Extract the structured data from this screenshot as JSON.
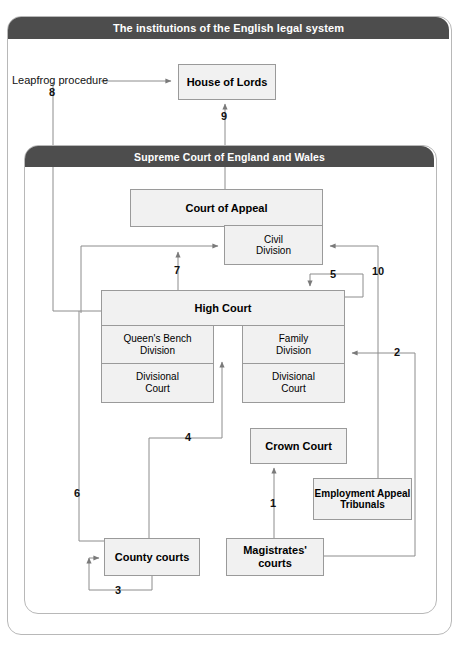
{
  "outer_frame": {
    "title": "The institutions of the English legal system"
  },
  "inner_frame": {
    "title": "Supreme Court of England and Wales"
  },
  "nodes": {
    "house_of_lords": "House of Lords",
    "court_of_appeal": "Court of Appeal",
    "civil_division": "Civil\nDivision",
    "civil_division_line1": "Civil",
    "civil_division_line2": "Division",
    "high_court": "High Court",
    "queens_bench_division_line1": "Queen's Bench",
    "queens_bench_division_line2": "Division",
    "qb_divisional_court_line1": "Divisional",
    "qb_divisional_court_line2": "Court",
    "family_division_line1": "Family",
    "family_division_line2": "Division",
    "fam_divisional_court_line1": "Divisional",
    "fam_divisional_court_line2": "Court",
    "crown_court": "Crown Court",
    "employment_appeal_tribunals_line1": "Employment Appeal",
    "employment_appeal_tribunals_line2": "Tribunals",
    "county_courts": "County courts",
    "magistrates_courts_line1": "Magistrates'",
    "magistrates_courts_line2": "courts"
  },
  "annotations": {
    "leapfrog": "Leapfrog procedure",
    "route_1": "1",
    "route_2": "2",
    "route_3": "3",
    "route_4": "4",
    "route_5": "5",
    "route_6": "6",
    "route_7": "7",
    "route_8": "8",
    "route_9": "9",
    "route_10": "10"
  },
  "colors": {
    "header_bar": "#4d4d4d",
    "header_text": "#ffffff",
    "node_fill": "#f1f1f1",
    "node_border": "#9a9a9a",
    "frame_border": "#b8b8b8",
    "wire": "#8c8c8c",
    "page_background": "#ffffff"
  }
}
